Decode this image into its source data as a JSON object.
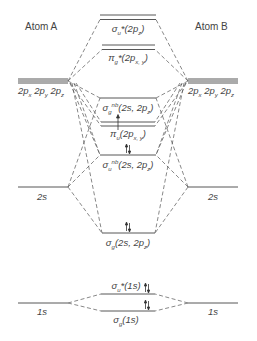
{
  "diagram": {
    "type": "molecular-orbital-energy-diagram",
    "atoms": {
      "left": {
        "label": "Atom A"
      },
      "right": {
        "label": "Atom B"
      }
    },
    "atomic_orbitals": {
      "2p": {
        "label_html": "2p<sub>x</sub> 2p<sub>y</sub> 2p<sub>z</sub>",
        "label": "2px 2py 2pz"
      },
      "2s": {
        "label": "2s"
      },
      "1s": {
        "label": "1s"
      }
    },
    "molecular_orbitals": [
      {
        "id": "sigma_u_star_2pz",
        "label_html": "σ<sub>u</sub>*(2p<sub>z</sub>)",
        "label": "σu*(2pz)",
        "electrons": ""
      },
      {
        "id": "pi_g_star_2pxy",
        "label_html": "π<sub>g</sub>*(2p<sub>x, y</sub>)",
        "label": "πg*(2px,y)",
        "electrons": ""
      },
      {
        "id": "sigma_g_nb_2s2pz",
        "label_html": "σ<sub>g</sub><sup>nb</sup>(2s, 2p<sub>z</sub>)",
        "label": "σg nb(2s, 2pz)",
        "electrons": ""
      },
      {
        "id": "pi_u_2pxy",
        "label_html": "π<sub>u</sub>(2p<sub>x, y</sub>)",
        "label": "πu(2px,y)",
        "electrons": "↑"
      },
      {
        "id": "sigma_u_nb_2s2pz",
        "label_html": "σ<sub>u</sub><sup>nb</sup>(2s, 2p<sub>z</sub>)",
        "label": "σu nb(2s, 2pz)",
        "electrons": "↑↓"
      },
      {
        "id": "sigma_g_2s2pz",
        "label_html": "σ<sub>g</sub>(2s, 2p<sub>z</sub>)",
        "label": "σg(2s, 2pz)",
        "electrons": "↑↓"
      },
      {
        "id": "sigma_u_star_1s",
        "label_html": "σ<sub>u</sub>*(1s)",
        "label": "σu*(1s)",
        "electrons": "↑↓"
      },
      {
        "id": "sigma_g_1s",
        "label_html": "σ<sub>g</sub>(1s)",
        "label": "σg(1s)",
        "electrons": "↑↓"
      }
    ],
    "colors": {
      "line": "#444444",
      "dash": "#555555",
      "text": "#444444"
    }
  }
}
